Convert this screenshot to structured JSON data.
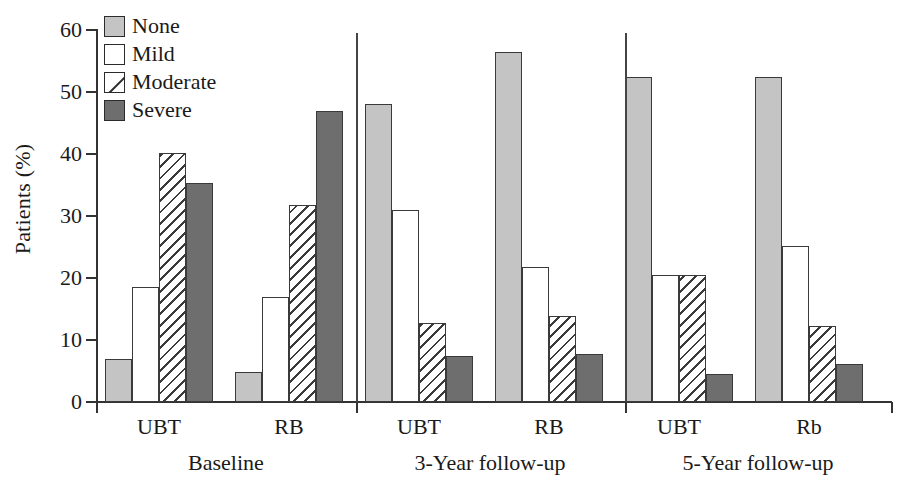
{
  "chart_data": {
    "type": "bar",
    "title": "",
    "xlabel": "",
    "ylabel": "Patients (%)",
    "ylim": [
      0,
      60
    ],
    "yticks": [
      0,
      10,
      20,
      30,
      40,
      50,
      60
    ],
    "ytick_labels": [
      "0",
      "10",
      "20",
      "30",
      "40",
      "50",
      "60"
    ],
    "grid": false,
    "legend_position": "top-left",
    "legend": [
      "None",
      "Mild",
      "Moderate",
      "Severe"
    ],
    "group_labels": [
      "Baseline",
      "3-Year follow-up",
      "5-Year follow-up"
    ],
    "categories": [
      "UBT",
      "RB",
      "UBT",
      "RB",
      "UBT",
      "Rb"
    ],
    "series": [
      {
        "name": "None",
        "values": [
          7.0,
          4.8,
          48.0,
          56.5,
          52.5,
          52.5
        ]
      },
      {
        "name": "Mild",
        "values": [
          18.5,
          17.0,
          31.0,
          21.8,
          20.5,
          25.2
        ]
      },
      {
        "name": "Moderate",
        "values": [
          40.2,
          31.8,
          12.8,
          13.8,
          20.5,
          12.3
        ]
      },
      {
        "name": "Severe",
        "values": [
          35.3,
          47.0,
          7.5,
          7.8,
          4.5,
          6.2
        ]
      }
    ],
    "colors": {
      "None": "#c4c4c4",
      "Mild": "#ffffff",
      "Moderate": "#ffffff",
      "Severe": "#6e6e6e",
      "axis": "#333333",
      "outline": "#3a3a3a"
    }
  },
  "axis": {
    "y_title": "Patients (%)"
  }
}
